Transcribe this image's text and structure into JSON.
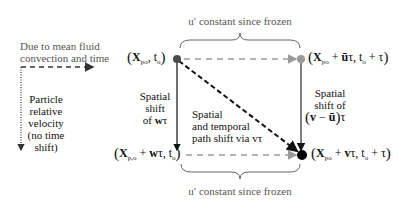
{
  "legend": {
    "mean_convection_label": "Due to mean fluid convection and time",
    "mean_convection_line1": "Due to mean fluid",
    "mean_convection_line2": "convection and time",
    "particle_relative_line1": "Particle",
    "particle_relative_line2": "relative",
    "particle_relative_line3": "velocity",
    "particle_relative_line4": "(no time",
    "particle_relative_line5": "shift)"
  },
  "braces": {
    "top_label": "u′ constant since frozen",
    "bottom_label": "u′ constant since frozen"
  },
  "nodes": {
    "top_left": {
      "X": "X",
      "sub": "po",
      "rest": ", t",
      "rest_sub": "o"
    },
    "top_right": {
      "X": "X",
      "sub": "po",
      "plus": " + ",
      "ubar": "ū",
      "tau": "τ",
      "rest": ", t",
      "rest_sub": "o",
      "tail": " + τ"
    },
    "bottom_left": {
      "X": "X",
      "sub": "p,o",
      "plus": " + ",
      "w": "w",
      "tau": "τ",
      "rest": ", t",
      "rest_sub": "o"
    },
    "bottom_right": {
      "X": "X",
      "sub": "po",
      "plus": " + ",
      "v": "v",
      "tau": "τ",
      "rest": ", t",
      "rest_sub": "o",
      "tail": " + τ"
    }
  },
  "edges": {
    "left_vertical_line1": "Spatial",
    "left_vertical_line2": "shift",
    "left_vertical_line3_prefix": "of ",
    "left_vertical_line3_bold": "w",
    "left_vertical_line3_tau": "τ",
    "diagonal_line1": "Spatial",
    "diagonal_line2": "and temporal",
    "diagonal_line3": "path shift via vτ",
    "right_vertical_line1": "Spatial",
    "right_vertical_line2": "shift of",
    "right_vertical_expr_v": "v",
    "right_vertical_expr_minus": " − ",
    "right_vertical_expr_ubar": "ū",
    "right_vertical_expr_tau": "τ"
  },
  "colors": {
    "node_top_left": "#4a4a4a",
    "node_top_right": "#9a9a9a",
    "node_bottom_right": "#000000",
    "dashed_gray": "#9a9a9a",
    "line_dark": "#222222",
    "brace": "#666666"
  }
}
